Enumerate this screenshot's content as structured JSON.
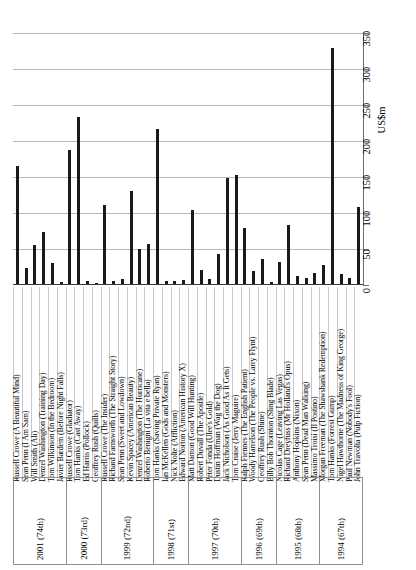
{
  "chart_data": {
    "type": "bar",
    "title": "",
    "xlabel": "",
    "ylabel": "US$m",
    "ylim": [
      0,
      350
    ],
    "yticks": [
      0,
      50,
      100,
      150,
      200,
      250,
      300,
      350
    ],
    "grid": true,
    "legend": "none",
    "orientation": "vertical-bars-with-rotated-category-labels",
    "categories": [
      "Russell Crowe (A Beautiful Mind)",
      "Sean Penn (I Am Sam)",
      "Will Smith (Ali)",
      "Denzel Washington (Training Day)",
      "Tom Wilkinson (In the Bedroom)",
      "Javier Bardem (Before Night Falls)",
      "Russell Crowe (Gladiator)",
      "Tom Hanks (Cast Away)",
      "Ed Harris (Pollock)",
      "Geoffrey Rush (Quills)",
      "Russell Crowe (The Insider)",
      "Richard Farnsworth (The Straight Story)",
      "Sean Penn (Sweet and Lowdown)",
      "Kevin Spacey (American Beauty)",
      "Denzel Washington (The Hurricane)",
      "Roberto Benigni (La vita e bella)",
      "Tom Hanks (Saving Private Ryan)",
      "Ian McKellen (Gods and Monsters)",
      "Nick Nolte (Affliction)",
      "Edward Norton (American History X)",
      "Matt Damon (Good Will Hunting)",
      "Robert Duvall (The Apostle)",
      "Peter Fonda (Ulee's Gold)",
      "Dustin Hoffman (Wag the Dog)",
      "Jack Nicholson (As Good As It Gets)",
      "Tom Cruise (Jerry Maguire)",
      "Ralph Fiennes (The English Patient)",
      "Woody Harrelson (The People vs. Larry Flynt)",
      "Geoffrey Rush (Shine)",
      "Billy Bob Thornton (Sling Blade)",
      "Nicolas Cage (Leaving Las Vegas)",
      "Richard Dreyfuss (Mr Holland's Opus)",
      "Anthony Hopkins (Nixon)",
      "Sean Penn (Dead Man Walking)",
      "Massimo Troisi (Il Postino)",
      "Morgan Freeman (The Shawshank Redemption)",
      "Tom Hanks (Forrest Gump)",
      "Nigel Hawthorne (The Madness of King George)",
      "Paul Newman (Nobody's Fool)",
      "John Travolta (Pulp Fiction)"
    ],
    "values": [
      165,
      23,
      55,
      74,
      31,
      4,
      188,
      234,
      5,
      3,
      111,
      6,
      9,
      130,
      50,
      57,
      216,
      5,
      6,
      7,
      104,
      21,
      9,
      43,
      148,
      153,
      79,
      20,
      36,
      4,
      32,
      83,
      13,
      10,
      17,
      28,
      329,
      15,
      10,
      108
    ],
    "groups": [
      {
        "label": "2001 (74th)",
        "count": 6
      },
      {
        "label": "2000 (73rd)",
        "count": 4
      },
      {
        "label": "1999 (72nd)",
        "count": 6
      },
      {
        "label": "1998 (71st)",
        "count": 4
      },
      {
        "label": "1997 (70th)",
        "count": 6
      },
      {
        "label": "1996 (69th)",
        "count": 4
      },
      {
        "label": "1995 (68th)",
        "count": 5
      },
      {
        "label": "1994 (67th)",
        "count": 5
      }
    ],
    "colors": {
      "bar": "#1a1a1a",
      "grid": "#b9b9b9",
      "axis": "#6d6d6d"
    }
  }
}
